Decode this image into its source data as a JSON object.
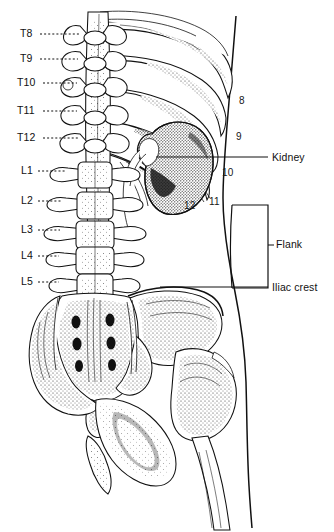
{
  "image": {
    "title": "Posterior anatomy of the torso: vertebral levels, ribs, kidney, flank and iliac crest",
    "type": "anatomical-line-drawing",
    "width": 334,
    "height": 532,
    "background_color": "#ffffff",
    "ink_color": "#111111"
  },
  "vertebra_labels": [
    {
      "text": "T8",
      "x": 20,
      "y": 37,
      "leader_from_x": 40,
      "leader_to_x": 80,
      "leader_y": 34
    },
    {
      "text": "T9",
      "x": 20,
      "y": 62,
      "leader_from_x": 40,
      "leader_to_x": 78,
      "leader_y": 59
    },
    {
      "text": "T10",
      "x": 17,
      "y": 86,
      "leader_from_x": 43,
      "leader_to_x": 77,
      "leader_y": 83
    },
    {
      "text": "T11",
      "x": 17,
      "y": 114,
      "leader_from_x": 43,
      "leader_to_x": 77,
      "leader_y": 111
    },
    {
      "text": "T12",
      "x": 17,
      "y": 141,
      "leader_from_x": 43,
      "leader_to_x": 78,
      "leader_y": 138
    },
    {
      "text": "L1",
      "x": 21,
      "y": 174,
      "leader_from_x": 38,
      "leader_to_x": 66,
      "leader_y": 171
    },
    {
      "text": "L2",
      "x": 21,
      "y": 204,
      "leader_from_x": 38,
      "leader_to_x": 62,
      "leader_y": 201
    },
    {
      "text": "L3",
      "x": 21,
      "y": 233,
      "leader_from_x": 38,
      "leader_to_x": 60,
      "leader_y": 230
    },
    {
      "text": "L4",
      "x": 21,
      "y": 259,
      "leader_from_x": 38,
      "leader_to_x": 59,
      "leader_y": 256
    },
    {
      "text": "L5",
      "x": 21,
      "y": 285,
      "leader_from_x": 38,
      "leader_to_x": 59,
      "leader_y": 282
    }
  ],
  "rib_numbers": [
    {
      "text": "8",
      "x": 239,
      "y": 104
    },
    {
      "text": "9",
      "x": 236,
      "y": 140
    },
    {
      "text": "10",
      "x": 222,
      "y": 176
    },
    {
      "text": "11",
      "x": 209,
      "y": 205
    },
    {
      "text": "12",
      "x": 184,
      "y": 209
    }
  ],
  "region_labels": [
    {
      "id": "kidney",
      "text": "Kidney",
      "x": 272,
      "y": 161,
      "leader": {
        "x1": 156,
        "y1": 157,
        "x2": 268,
        "y2": 157
      }
    },
    {
      "id": "flank",
      "text": "Flank",
      "x": 276,
      "y": 248,
      "leader": {
        "x1": 268,
        "y1": 245,
        "x2": 274,
        "y2": 245
      }
    },
    {
      "id": "iliac-crest",
      "text": "Iliac crest",
      "x": 272,
      "y": 291,
      "leader": {
        "x1": 160,
        "y1": 287,
        "x2": 268,
        "y2": 287
      }
    }
  ],
  "flank_box": {
    "x": 232,
    "y": 205,
    "width": 36,
    "height": 83
  }
}
